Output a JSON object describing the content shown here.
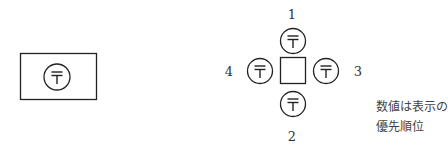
{
  "figure": {
    "left_symbol": {
      "frame": "rectangle",
      "icon": "postal-mark-icon",
      "glyph": "〒"
    },
    "right_symbol": {
      "center": "square",
      "icon": "postal-mark-icon",
      "glyph": "〒",
      "positions": [
        {
          "position": "top",
          "label": "1"
        },
        {
          "position": "bottom",
          "label": "2"
        },
        {
          "position": "right",
          "label": "3"
        },
        {
          "position": "left",
          "label": "4"
        }
      ]
    },
    "note": {
      "line1": "数値は表示の",
      "line2": "優先順位"
    }
  }
}
